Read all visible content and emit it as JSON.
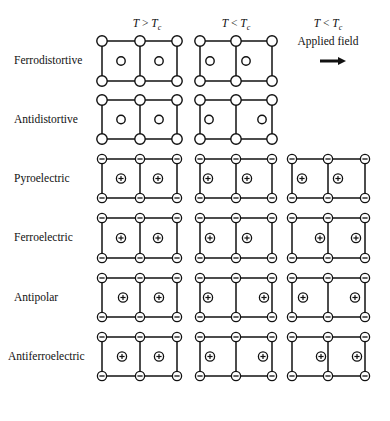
{
  "columns": [
    {
      "id": "high",
      "header_T": "T",
      "header_rel": ">",
      "header_Tc": "T",
      "header_sub": "c",
      "center_x": 140
    },
    {
      "id": "low",
      "header_T": "T",
      "header_rel": "<",
      "header_Tc": "T",
      "header_sub": "c",
      "center_x": 236
    },
    {
      "id": "field",
      "header_T": "T",
      "header_rel": "<",
      "header_Tc": "T",
      "header_sub": "c",
      "subheader": "Applied field",
      "center_x": 328,
      "arrow": "right-arrow"
    }
  ],
  "rows": [
    {
      "label": "Ferrodistortive",
      "type": "neutral",
      "top": 41,
      "bottom": 81,
      "cells": [
        {
          "centers": [
            121,
            159
          ]
        },
        {
          "centers": [
            210,
            246
          ]
        },
        null
      ]
    },
    {
      "label": "Antidistortive",
      "type": "neutral",
      "top": 100,
      "bottom": 139,
      "cells": [
        {
          "centers": [
            121,
            159
          ]
        },
        {
          "centers": [
            209,
            262
          ]
        },
        null
      ]
    },
    {
      "label": "Pyroelectric",
      "type": "ionic",
      "top": 159,
      "bottom": 198,
      "cells": [
        {
          "centers": [
            121,
            158
          ]
        },
        {
          "centers": [
            208,
            247
          ]
        },
        {
          "centers": [
            302,
            338
          ]
        }
      ]
    },
    {
      "label": "Ferroelectric",
      "type": "ionic",
      "top": 218,
      "bottom": 258,
      "cells": [
        {
          "centers": [
            121,
            158
          ]
        },
        {
          "centers": [
            210,
            247
          ]
        },
        {
          "centers": [
            320,
            356
          ]
        }
      ]
    },
    {
      "label": "Antipolar",
      "type": "ionic",
      "top": 278,
      "bottom": 317,
      "cells": [
        {
          "centers": [
            123,
            159
          ]
        },
        {
          "centers": [
            208,
            264
          ]
        },
        {
          "centers": [
            303,
            355
          ]
        }
      ]
    },
    {
      "label": "Antiferroelectric",
      "type": "ionic",
      "top": 337,
      "bottom": 376,
      "cells": [
        {
          "centers": [
            122,
            159
          ]
        },
        {
          "centers": [
            210,
            263
          ]
        },
        {
          "centers": [
            321,
            357
          ]
        }
      ]
    }
  ],
  "grid_x": [
    [
      102,
      140,
      177
    ],
    [
      200,
      236,
      272
    ],
    [
      292,
      328,
      365
    ]
  ],
  "symbols": {
    "neutral_corner": "open-circle",
    "neutral_center": "open-circle",
    "ionic_corner": "minus",
    "ionic_center": "plus"
  },
  "colors": {
    "stroke": "#111111",
    "background": "#ffffff"
  }
}
